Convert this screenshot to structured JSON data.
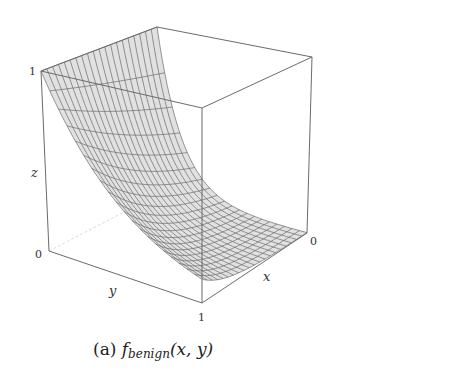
{
  "chart_data": {
    "type": "surface3d",
    "title": "",
    "caption": {
      "label": "(a)",
      "function": "f",
      "subscript": "benign",
      "args": "(x, y)"
    },
    "axes": {
      "x": {
        "label": "x",
        "range": [
          0,
          1
        ],
        "ticks": [
          "0"
        ]
      },
      "y": {
        "label": "y",
        "range": [
          0,
          1
        ],
        "ticks": [
          "1"
        ]
      },
      "z": {
        "label": "z",
        "range": [
          0,
          1
        ],
        "ticks": [
          "0",
          "1"
        ]
      }
    },
    "grid": false,
    "colors": {
      "surface_fill": "#d9d9d9",
      "mesh": "#555555",
      "box": "#666666"
    }
  },
  "labels": {
    "z_tick_top": "1",
    "z_tick_bottom": "0",
    "z_axis": "z",
    "y_axis": "y",
    "y_tick": "1",
    "x_axis": "x",
    "x_tick": "0"
  }
}
